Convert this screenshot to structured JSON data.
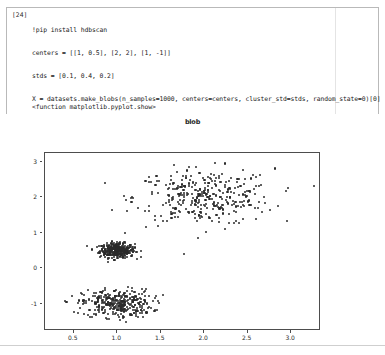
{
  "notebook": {
    "cell": {
      "prompt": "[24]",
      "code_lines": [
        "!pip install hdbscan",
        "centers = [[1, 0.5], [2, 2], [1, -1]]",
        "stds = [0.1, 0.4, 0.2]",
        "X = datasets.make_blobs(n_samples=1000, centers=centers, cluster_std=stds, random_state=0)[0]",
        "x=X[:,0]",
        "y=X[:,1]",
        "plt.figure(figsize=(10,7))",
        "plt.scatter(x, y)",
        "plt.suptitle(\"blob\")",
        "plt.show"
      ],
      "output_text": "<function matplotlib.pyplot.show>"
    }
  },
  "chart_data": {
    "type": "scatter",
    "title": "blob",
    "xlabel": "",
    "ylabel": "",
    "xlim": [
      0.17,
      3.32
    ],
    "ylim": [
      -1.72,
      3.25
    ],
    "xticks": [
      0.5,
      1.0,
      1.5,
      2.0,
      2.5,
      3.0
    ],
    "xticklabels": [
      "0.5",
      "1.0",
      "1.5",
      "2.0",
      "2.5",
      "3.0"
    ],
    "yticks": [
      -1,
      0,
      1,
      2,
      3
    ],
    "yticklabels": [
      "-1",
      "0",
      "1",
      "2",
      "3"
    ],
    "grid": false,
    "legend": null,
    "marker_color": "#2b2b2b",
    "n_samples": 1000,
    "random_state": 0,
    "clusters": [
      {
        "center": [
          1,
          0.5
        ],
        "std": 0.1,
        "n": 334
      },
      {
        "center": [
          2,
          2
        ],
        "std": 0.4,
        "n": 333
      },
      {
        "center": [
          1,
          -1
        ],
        "std": 0.2,
        "n": 333
      }
    ]
  }
}
